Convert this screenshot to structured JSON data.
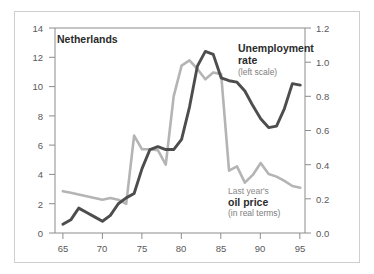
{
  "chart_data": {
    "type": "line",
    "title": "Netherlands",
    "xlabel": "",
    "ylabel": "",
    "xlim": [
      64,
      95.6
    ],
    "xticks": [
      65,
      70,
      75,
      80,
      85,
      90,
      95
    ],
    "xtick_labels": [
      "65",
      "70",
      "75",
      "80",
      "85",
      "90",
      "95"
    ],
    "grid": false,
    "legend_position": "inline-annotations",
    "axes": [
      {
        "id": "left",
        "side": "left",
        "ylim": [
          0,
          14
        ],
        "yticks": [
          0,
          2,
          4,
          6,
          8,
          10,
          12,
          14
        ],
        "ytick_labels": [
          "0",
          "2",
          "4",
          "6",
          "8",
          "10",
          "12",
          "14"
        ]
      },
      {
        "id": "right",
        "side": "right",
        "ylim": [
          0.0,
          1.2
        ],
        "yticks": [
          0.0,
          0.2,
          0.4,
          0.6,
          0.8,
          1.0,
          1.2
        ],
        "ytick_labels": [
          "0.0",
          "0.2",
          "0.4",
          "0.6",
          "0.8",
          "1.0",
          "1.2"
        ]
      }
    ],
    "series": [
      {
        "name": "Unemployment rate",
        "axis": "left",
        "color": "#4d4d4d",
        "x": [
          65,
          66,
          67,
          68,
          69,
          70,
          71,
          72,
          73,
          74,
          75,
          76,
          77,
          78,
          79,
          80,
          81,
          82,
          83,
          84,
          85,
          86,
          87,
          88,
          89,
          90,
          91,
          92,
          93,
          94,
          95
        ],
        "values": [
          0.6,
          0.9,
          1.7,
          1.4,
          1.1,
          0.8,
          1.2,
          2.0,
          2.4,
          2.7,
          4.4,
          5.7,
          5.9,
          5.7,
          5.7,
          6.4,
          8.6,
          11.4,
          12.4,
          12.2,
          10.6,
          10.4,
          10.3,
          9.7,
          8.7,
          7.8,
          7.2,
          7.3,
          8.5,
          10.2,
          10.1
        ]
      },
      {
        "name": "Last year's oil price (in real terms)",
        "axis": "right",
        "color": "#b4b4b4",
        "x": [
          65,
          66,
          67,
          68,
          69,
          70,
          71,
          72,
          73,
          74,
          75,
          76,
          77,
          78,
          79,
          80,
          81,
          82,
          83,
          84,
          85,
          86,
          87,
          88,
          89,
          90,
          91,
          92,
          93,
          94,
          95
        ],
        "values": [
          0.245,
          0.235,
          0.225,
          0.215,
          0.205,
          0.195,
          0.205,
          0.195,
          0.17,
          0.57,
          0.49,
          0.49,
          0.485,
          0.4,
          0.8,
          0.98,
          1.01,
          0.96,
          0.9,
          0.94,
          0.93,
          0.365,
          0.39,
          0.295,
          0.34,
          0.41,
          0.345,
          0.33,
          0.305,
          0.275,
          0.265
        ]
      }
    ],
    "annotations": [
      {
        "id": "unemployment",
        "lines": [
          "Unemployment",
          "rate"
        ],
        "sub": "(left scale)"
      },
      {
        "id": "oil",
        "pre": "Last year's",
        "lines": [
          "oil price"
        ],
        "sub": "(in real terms)"
      }
    ]
  },
  "colors": {
    "unemployment_line": "#4d4d4d",
    "oil_line": "#b4b4b4",
    "axis": "#8c8c8c",
    "tick_text": "#58595b",
    "frame_border": "#cfcfcf",
    "background": "#ffffff"
  },
  "annotations": {
    "unemployment": {
      "line1": "Unemployment",
      "line2": "rate",
      "sub": "(left scale)"
    },
    "oil": {
      "pre": "Last year's",
      "line1": "oil price",
      "sub": "(in real terms)"
    }
  },
  "axis_labels": {
    "left": [
      "14",
      "12",
      "10",
      "8",
      "6",
      "4",
      "2",
      "0"
    ],
    "right": [
      "1.2",
      "1.0",
      "0.8",
      "0.6",
      "0.4",
      "0.2",
      "0.0"
    ],
    "bottom": [
      "65",
      "70",
      "75",
      "80",
      "85",
      "90",
      "95"
    ]
  }
}
